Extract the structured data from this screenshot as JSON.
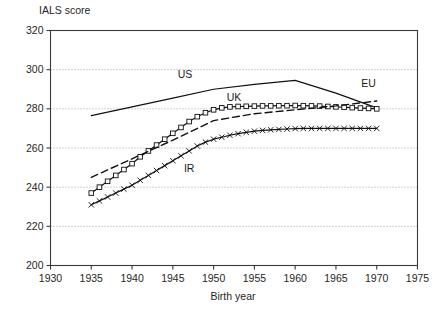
{
  "chart_data": {
    "type": "line",
    "title": "",
    "xlabel": "Birth year",
    "ylabel": "IALS score",
    "xlim": [
      1930,
      1975
    ],
    "ylim": [
      200,
      320
    ],
    "xticks": [
      1930,
      1935,
      1940,
      1945,
      1950,
      1955,
      1960,
      1965,
      1970,
      1975
    ],
    "yticks": [
      200,
      220,
      240,
      260,
      280,
      300,
      320
    ],
    "grid": true,
    "grid_axis": "y",
    "legend_position": "inline-annotations",
    "series": [
      {
        "name": "US",
        "label": "US",
        "style": "solid",
        "marker": "none",
        "label_x": 1946.5,
        "label_y": 296,
        "x": [
          1935,
          1940,
          1945,
          1950,
          1955,
          1960,
          1965,
          1970
        ],
        "values": [
          276.5,
          281.0,
          285.5,
          290.0,
          292.5,
          294.5,
          288.0,
          280.5
        ]
      },
      {
        "name": "UK",
        "label": "UK",
        "style": "solid",
        "marker": "square",
        "label_x": 1952.5,
        "label_y": 284,
        "x": [
          1935,
          1936,
          1937,
          1938,
          1939,
          1940,
          1941,
          1942,
          1943,
          1944,
          1945,
          1946,
          1947,
          1948,
          1949,
          1950,
          1951,
          1952,
          1953,
          1954,
          1955,
          1956,
          1957,
          1958,
          1959,
          1960,
          1961,
          1962,
          1963,
          1964,
          1965,
          1966,
          1967,
          1968,
          1969,
          1970
        ],
        "values": [
          237.0,
          240.0,
          243.0,
          246.0,
          249.0,
          252.0,
          255.5,
          258.5,
          261.5,
          264.5,
          267.5,
          270.5,
          273.5,
          276.0,
          278.0,
          279.5,
          280.5,
          281.0,
          281.2,
          281.3,
          281.4,
          281.5,
          281.5,
          281.6,
          281.6,
          281.7,
          281.6,
          281.5,
          281.4,
          281.2,
          281.0,
          280.8,
          280.6,
          280.4,
          280.2,
          280.0
        ]
      },
      {
        "name": "IR",
        "label": "IR",
        "style": "solid",
        "marker": "cross",
        "label_x": 1947.0,
        "label_y": 248,
        "x": [
          1935,
          1936,
          1937,
          1938,
          1939,
          1940,
          1941,
          1942,
          1943,
          1944,
          1945,
          1946,
          1947,
          1948,
          1949,
          1950,
          1951,
          1952,
          1953,
          1954,
          1955,
          1956,
          1957,
          1958,
          1959,
          1960,
          1961,
          1962,
          1963,
          1964,
          1965,
          1966,
          1967,
          1968,
          1969,
          1970
        ],
        "values": [
          231.0,
          233.0,
          235.0,
          237.0,
          239.0,
          241.0,
          243.5,
          246.0,
          248.5,
          251.0,
          253.5,
          256.0,
          258.5,
          261.0,
          263.0,
          264.5,
          265.5,
          266.5,
          267.3,
          268.0,
          268.6,
          269.0,
          269.3,
          269.5,
          269.7,
          269.9,
          270.0,
          270.0,
          270.0,
          270.0,
          270.0,
          270.0,
          270.0,
          270.0,
          270.0,
          270.0
        ]
      },
      {
        "name": "EU",
        "label": "EU",
        "style": "dashed",
        "marker": "none",
        "label_x": 1969.0,
        "label_y": 291,
        "x": [
          1935,
          1940,
          1945,
          1950,
          1955,
          1960,
          1965,
          1970
        ],
        "values": [
          245.0,
          254.5,
          264.0,
          274.0,
          277.5,
          279.5,
          281.5,
          284.0
        ]
      }
    ]
  },
  "axes": {
    "y_axis_title": "IALS score",
    "x_axis_title": "Birth year"
  }
}
